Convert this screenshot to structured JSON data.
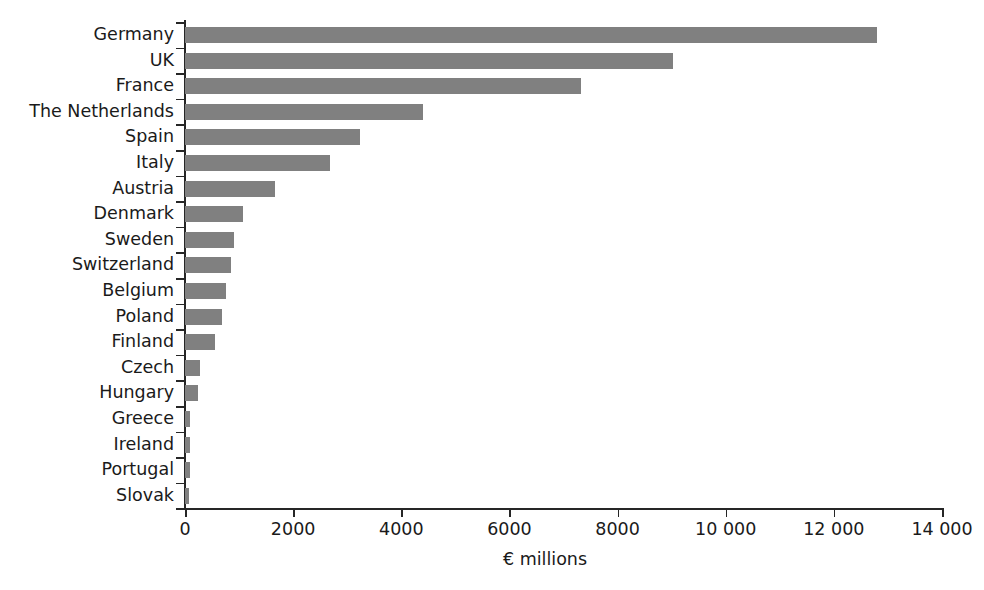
{
  "chart_data": {
    "type": "bar",
    "orientation": "horizontal",
    "title": "",
    "subtitle": "",
    "xlabel": "€ millions",
    "ylabel": "",
    "xlim": [
      0,
      14000
    ],
    "grid": false,
    "legend": null,
    "bar_color": "#808080",
    "axis_color": "#262626",
    "text_color": "#1a1a1a",
    "xticks": [
      0,
      2000,
      4000,
      6000,
      8000,
      10000,
      12000,
      14000
    ],
    "xticklabels": [
      "0",
      "2000",
      "4000",
      "6000",
      "8000",
      "10 000",
      "12 000",
      "14 000"
    ],
    "categories": [
      "Germany",
      "UK",
      "France",
      "The Netherlands",
      "Spain",
      "Italy",
      "Austria",
      "Denmark",
      "Sweden",
      "Switzerland",
      "Belgium",
      "Poland",
      "Finland",
      "Czech",
      "Hungary",
      "Greece",
      "Ireland",
      "Portugal",
      "Slovak"
    ],
    "values": [
      12800,
      9020,
      7320,
      4400,
      3230,
      2680,
      1660,
      1070,
      905,
      850,
      760,
      680,
      555,
      280,
      240,
      100,
      85,
      85,
      80
    ],
    "series": [
      {
        "name": "€ millions",
        "values": [
          12800,
          9020,
          7320,
          4400,
          3230,
          2680,
          1660,
          1070,
          905,
          850,
          760,
          680,
          555,
          280,
          240,
          100,
          85,
          85,
          80
        ]
      }
    ]
  }
}
